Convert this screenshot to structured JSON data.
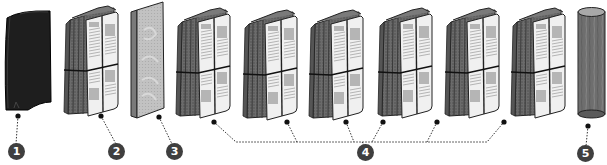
{
  "diagram": {
    "type": "exploded-view of filter layers",
    "colors": {
      "callout_fill": "#3f3f3f",
      "callout_text": "#ffffff",
      "dark_filter": "#1e1e1e",
      "pleat_gray": "#6b6b6b",
      "paper": "#efefef",
      "panel": "#bdbdbd",
      "cylinder": "#6e6e6e",
      "leader_line": "#333333"
    },
    "components": [
      {
        "id": 1,
        "label": "1",
        "shape": "dark-curved-filter"
      },
      {
        "id": 2,
        "label": "2",
        "shape": "pleated-filter-with-paper-wrap"
      },
      {
        "id": 3,
        "label": "3",
        "shape": "flat-mesh-panel"
      },
      {
        "id": 4,
        "label": "4",
        "shape": "pleated-filter-with-paper-wrap",
        "count": 6
      },
      {
        "id": 5,
        "label": "5",
        "shape": "cylinder-rod"
      }
    ],
    "callouts": [
      "1",
      "2",
      "3",
      "4",
      "5"
    ]
  }
}
